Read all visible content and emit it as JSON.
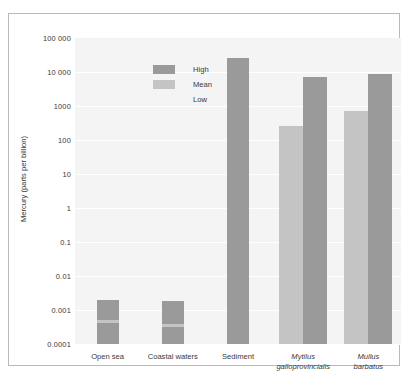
{
  "chart_data": {
    "type": "bar",
    "title": "",
    "xlabel": "",
    "ylabel": "Mercury (parts per billion)",
    "yscale": "log",
    "ylim": [
      0.0001,
      100000
    ],
    "grid": true,
    "legend_position": "top-left",
    "ytick_labels": [
      "100 000",
      "10 000",
      "1000",
      "100",
      "10",
      "1",
      "0.1",
      "0.01",
      "0.001",
      "0.0001"
    ],
    "ytick_values": [
      100000,
      10000,
      1000,
      100,
      10,
      1,
      0.1,
      0.01,
      0.001,
      0.0001
    ],
    "categories": [
      "Open sea",
      "Coastal waters",
      "Sediment",
      "Mytilus galloprovincialis",
      "Mullus barbatus"
    ],
    "series": [
      {
        "name": "High",
        "color": "#9a9a9a",
        "values": [
          0.002,
          0.0018,
          25000,
          7000,
          9000
        ]
      },
      {
        "name": "Mean",
        "color": "#c4c4c4",
        "values": [
          0.0005,
          0.0004,
          null,
          250,
          700
        ]
      },
      {
        "name": "Low",
        "color": "#f4f4f4",
        "values": [
          null,
          null,
          null,
          null,
          null
        ]
      }
    ]
  },
  "legend": {
    "items": [
      {
        "label": "High",
        "swatch": "high"
      },
      {
        "label": "Mean",
        "swatch": "mean"
      },
      {
        "label": "Low",
        "swatch": "low"
      }
    ]
  },
  "axis": {
    "y_title": "Mercury (parts per billion)"
  },
  "xlabels": [
    {
      "line1": "Open sea",
      "line2": "",
      "italic": false
    },
    {
      "line1": "Coastal waters",
      "line2": "",
      "italic": false
    },
    {
      "line1": "Sediment",
      "line2": "",
      "italic": false
    },
    {
      "line1": "Mytilus",
      "line2": "galloprovincialis",
      "italic": true
    },
    {
      "line1": "Mullus",
      "line2": "barbatus",
      "italic": true
    }
  ],
  "colors": {
    "high": "#9a9a9a",
    "mean": "#c4c4c4",
    "plot_background": "#f4f4f4",
    "gridline": "#ffffff",
    "frame": "#b9b9b9",
    "text": "#3a3a3a"
  }
}
